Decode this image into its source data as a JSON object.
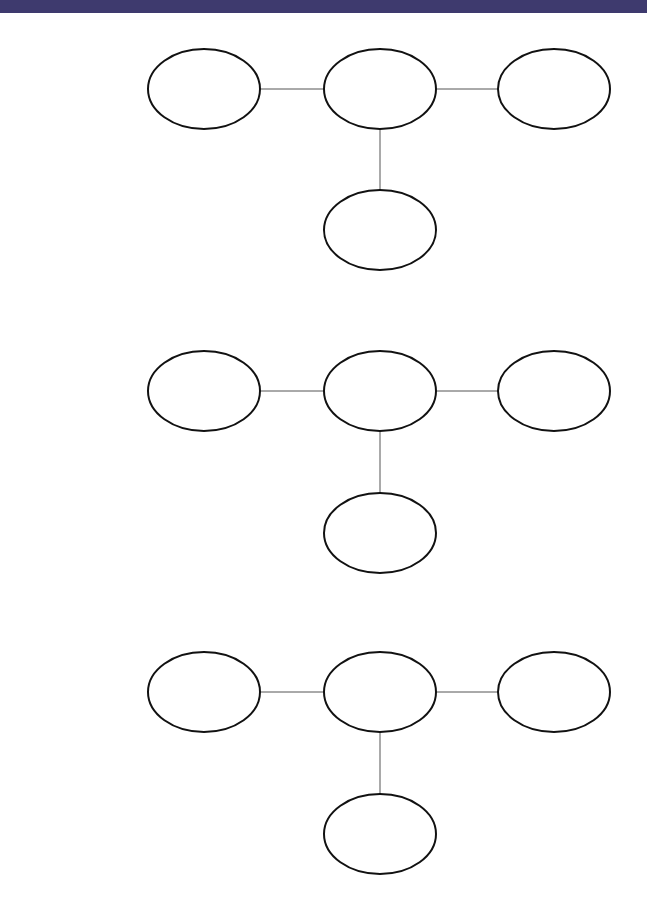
{
  "colors": {
    "header_band": "#3e3a6e",
    "background": "#ffffff",
    "node_stroke": "#111111",
    "edge_stroke": "#555555"
  },
  "diagram": {
    "node_rx": 56,
    "node_ry": 40,
    "groups": [
      {
        "id": "group-1",
        "nodes": [
          {
            "id": "left",
            "cx": 204,
            "cy": 89,
            "label": ""
          },
          {
            "id": "center",
            "cx": 380,
            "cy": 89,
            "label": ""
          },
          {
            "id": "right",
            "cx": 554,
            "cy": 89,
            "label": ""
          },
          {
            "id": "bottom",
            "cx": 380,
            "cy": 230,
            "label": ""
          }
        ],
        "edges": [
          [
            "left",
            "center"
          ],
          [
            "center",
            "right"
          ],
          [
            "center",
            "bottom"
          ]
        ]
      },
      {
        "id": "group-2",
        "nodes": [
          {
            "id": "left",
            "cx": 204,
            "cy": 391,
            "label": ""
          },
          {
            "id": "center",
            "cx": 380,
            "cy": 391,
            "label": ""
          },
          {
            "id": "right",
            "cx": 554,
            "cy": 391,
            "label": ""
          },
          {
            "id": "bottom",
            "cx": 380,
            "cy": 533,
            "label": ""
          }
        ],
        "edges": [
          [
            "left",
            "center"
          ],
          [
            "center",
            "right"
          ],
          [
            "center",
            "bottom"
          ]
        ]
      },
      {
        "id": "group-3",
        "nodes": [
          {
            "id": "left",
            "cx": 204,
            "cy": 692,
            "label": ""
          },
          {
            "id": "center",
            "cx": 380,
            "cy": 692,
            "label": ""
          },
          {
            "id": "right",
            "cx": 554,
            "cy": 692,
            "label": ""
          },
          {
            "id": "bottom",
            "cx": 380,
            "cy": 834,
            "label": ""
          }
        ],
        "edges": [
          [
            "left",
            "center"
          ],
          [
            "center",
            "right"
          ],
          [
            "center",
            "bottom"
          ]
        ]
      }
    ]
  }
}
